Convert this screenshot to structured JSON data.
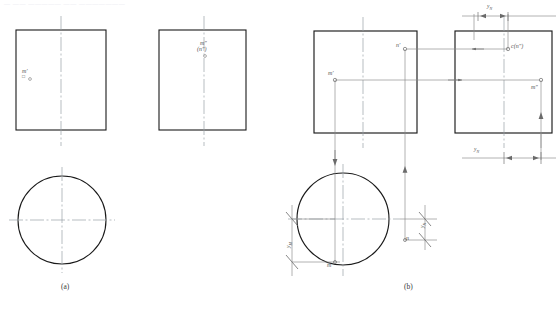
{
  "header": {
    "text": "—  ——  —————   ——   ———————"
  },
  "figure": {
    "type": "engineering-orthographic-projection",
    "captions": {
      "a": "(a)",
      "b": "(b)"
    },
    "colors": {
      "outline": "#1a1a1a",
      "centerline": "#9aa0a6",
      "projection": "#7a7a7a",
      "dimension": "#7a7a7a",
      "text": "#555555"
    }
  },
  "panel_a": {
    "name": "(a)",
    "front_view": {
      "label": "",
      "point_label": "m′",
      "point_label_sub": "□"
    },
    "side_view": {
      "label_top": "m″",
      "label_bottom": "(n″)"
    },
    "top_view": {
      "shape": "circle"
    }
  },
  "panel_b": {
    "name": "(b)",
    "front_view": {
      "point_m_prime": "m′",
      "point_n_prime": "n′"
    },
    "side_view": {
      "point_c_n": "c(n″)",
      "point_m": "m″"
    },
    "top_view": {
      "point_m": "m",
      "point_n": "n"
    },
    "dimensions": {
      "y_n_top": "y",
      "y_n_top_sub": "N",
      "y_n_bottom": "y",
      "y_n_bottom_sub": "N",
      "y_m_left": "y",
      "y_m_left_sub": "M",
      "y_n_right": "y",
      "y_n_right_sub": "N"
    }
  }
}
